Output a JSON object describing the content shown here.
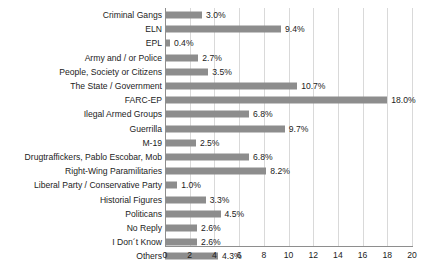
{
  "chart_data": {
    "type": "bar",
    "orientation": "horizontal",
    "title": "",
    "xlabel": "",
    "ylabel": "",
    "xlim": [
      0,
      20
    ],
    "xticks": [
      "0",
      "2",
      "4",
      "6",
      "8",
      "10",
      "12",
      "14",
      "16",
      "18",
      "20"
    ],
    "grid": "vertical",
    "legend": "none",
    "value_suffix": "%",
    "bar_color": "#8d8d8d",
    "grid_color": "#d9d9d9",
    "axis_color": "#8e8e8e",
    "categories": [
      "Criminal Gangs",
      "ELN",
      "EPL",
      "Army and / or Police",
      "People, Society or Citizens",
      "The State / Government",
      "FARC-EP",
      "Ilegal Armed Groups",
      "Guerrilla",
      "M-19",
      "Drugtraffickers, Pablo Escobar, Mob",
      "Right-Wing Paramilitaries",
      "Liberal Party / Conservative Party",
      "Historial Figures",
      "Politicans",
      "No Reply",
      "I Don´t Know",
      "Others"
    ],
    "values": [
      3.0,
      9.4,
      0.4,
      2.7,
      3.5,
      10.7,
      18.0,
      6.8,
      9.7,
      2.5,
      6.8,
      8.2,
      1.0,
      3.3,
      4.5,
      2.6,
      2.6,
      4.3
    ],
    "data_labels": [
      "3.0%",
      "9.4%",
      "0.4%",
      "2.7%",
      "3.5%",
      "10.7%",
      "18.0%",
      "6.8%",
      "9.7%",
      "2.5%",
      "6.8%",
      "8.2%",
      "1.0%",
      "3.3%",
      "4.5%",
      "2.6%",
      "2.6%",
      "4.3%"
    ]
  }
}
